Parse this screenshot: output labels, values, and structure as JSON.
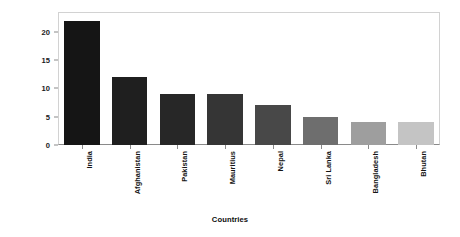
{
  "chart_data": {
    "type": "bar",
    "title": "",
    "xlabel": "Countries",
    "ylabel": "Number of Ethnic Groups",
    "categories": [
      "India",
      "Afghanistan",
      "Pakistan",
      "Mauritius",
      "Nepal",
      "Sri Lanka",
      "Bangladesh",
      "Bhutan"
    ],
    "values": [
      22,
      12,
      9,
      9,
      7,
      5,
      4,
      4
    ],
    "bar_colors": [
      "#151515",
      "#1f1f1f",
      "#272727",
      "#353535",
      "#484848",
      "#6e6e6e",
      "#9e9e9e",
      "#c4c4c4"
    ],
    "ylim": [
      0,
      23.5
    ],
    "yticks": [
      0,
      5,
      10,
      15,
      20
    ],
    "ytick_labels": [
      "0",
      "5",
      "10",
      "15",
      "20"
    ],
    "grid": false,
    "legend": "none",
    "axis_color": "#8a8a8a",
    "plot_border_color": "#d2d2d2",
    "background": "#ffffff"
  }
}
